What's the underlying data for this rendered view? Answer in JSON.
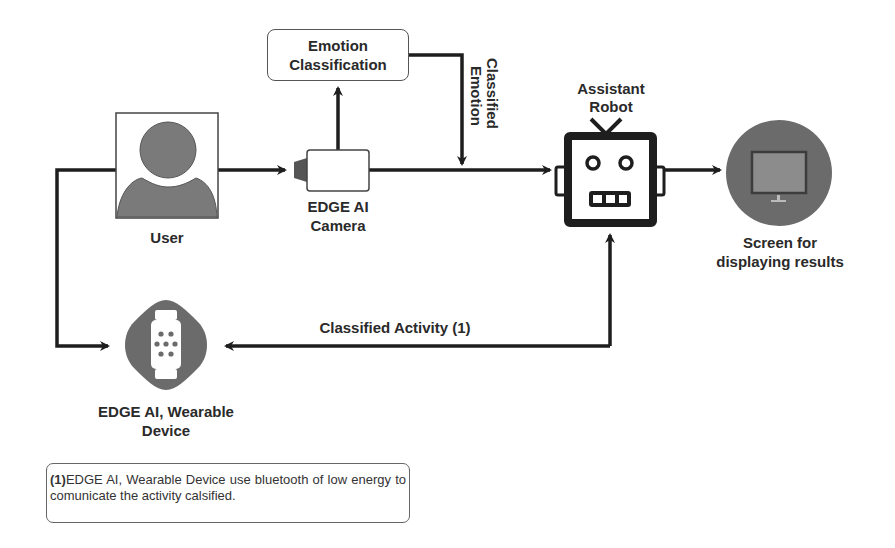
{
  "diagram": {
    "nodes": {
      "user": {
        "label": "User"
      },
      "camera": {
        "label_line1": "EDGE AI",
        "label_line2": "Camera"
      },
      "emotion_classification": {
        "label_line1": "Emotion",
        "label_line2": "Classification"
      },
      "robot": {
        "label_line1": "Assistant",
        "label_line2": "Robot"
      },
      "screen": {
        "label_line1": "Screen for",
        "label_line2": "displaying results"
      },
      "wearable": {
        "label_line1": "EDGE AI, Wearable",
        "label_line2": "Device"
      }
    },
    "edges": {
      "classified_emotion": {
        "line1": "Classified",
        "line2": "Emotion"
      },
      "classified_activity": {
        "label": "Classified Activity (1)"
      }
    },
    "footnote": {
      "marker": "(1)",
      "text": "EDGE AI, Wearable Device use bluetooth of low energy to comunicate the activity calsified."
    },
    "colors": {
      "icon_fill": "#6b6b6b",
      "icon_dark": "#4a4a4a",
      "line": "#1e1e1e",
      "monitor_screen": "#8a8a8a"
    }
  }
}
